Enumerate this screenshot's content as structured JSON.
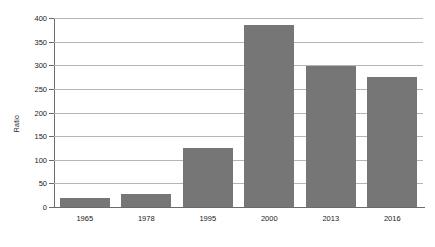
{
  "chart_data": {
    "type": "bar",
    "title": "",
    "subtitle": "",
    "xlabel": "",
    "ylabel": "Ratio",
    "categories": [
      "1965",
      "1978",
      "1995",
      "2000",
      "2013",
      "2016"
    ],
    "values": [
      20,
      28,
      125,
      385,
      299,
      275
    ],
    "series": [
      {
        "name": "Ratio",
        "values": [
          20,
          28,
          125,
          385,
          299,
          275
        ]
      }
    ],
    "ylim": [
      0,
      400
    ],
    "xlim": null,
    "ytick_labels": [
      "0",
      "50",
      "100",
      "150",
      "200",
      "250",
      "300",
      "350",
      "400"
    ],
    "ytick_values": [
      0,
      50,
      100,
      150,
      200,
      250,
      300,
      350,
      400
    ],
    "grid": true,
    "grid_axis": "y",
    "legend": false,
    "legend_position": "none",
    "annotations": [],
    "bar_color": "#767676",
    "grid_color": "#b5b5b5",
    "axis_color": "#6b6b6b",
    "background_color": "#ffffff",
    "text_color": "#1a1a1a"
  }
}
